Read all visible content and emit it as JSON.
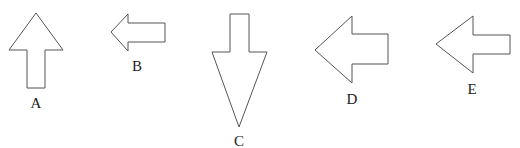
{
  "figure": {
    "arrows": [
      {
        "label": "A",
        "direction": "up"
      },
      {
        "label": "B",
        "direction": "left"
      },
      {
        "label": "C",
        "direction": "down"
      },
      {
        "label": "D",
        "direction": "left"
      },
      {
        "label": "E",
        "direction": "left"
      }
    ],
    "stroke_color": "#555555",
    "fill_color": "#ffffff"
  }
}
